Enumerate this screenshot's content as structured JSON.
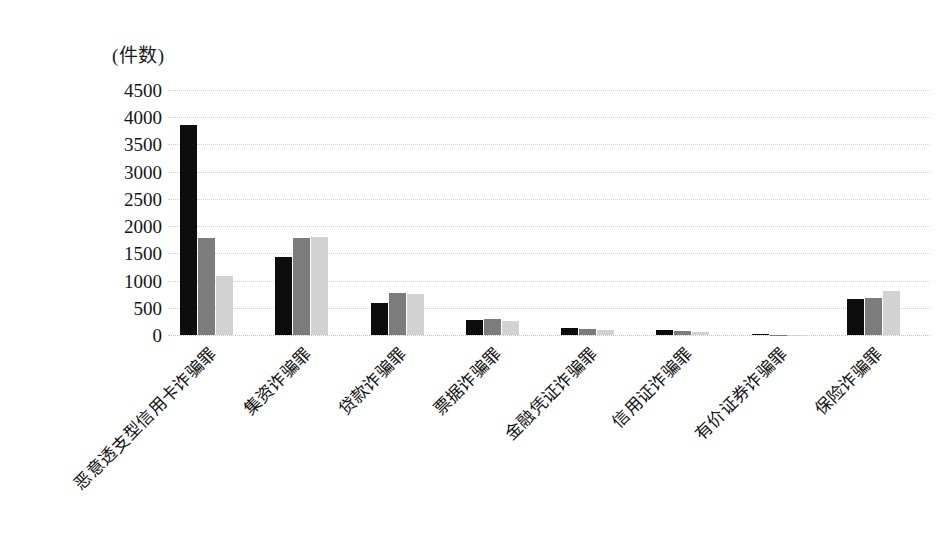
{
  "chart": {
    "unit_caption": "(件数)",
    "y_axis": {
      "ticks": [
        "0",
        "500",
        "1000",
        "1500",
        "2000",
        "2500",
        "3000",
        "3500",
        "4000",
        "4500"
      ],
      "min": 0,
      "max": 4500,
      "step": 500
    }
  },
  "chart_data": {
    "type": "bar",
    "title": "",
    "subtitle": "",
    "xlabel": "",
    "ylabel": "(件数)",
    "ylim": [
      0,
      4500
    ],
    "ytick_step": 500,
    "grid": true,
    "legend": "none",
    "orientation": "vertical",
    "grouping": "clustered",
    "categories": [
      "恶意透支型信用卡诈骗罪",
      "集资诈骗罪",
      "贷款诈骗罪",
      "票据诈骗罪",
      "金融凭证诈骗罪",
      "信用证诈骗罪",
      "有价证券诈骗罪",
      "保险诈骗罪"
    ],
    "series": [
      {
        "name": "series-1",
        "color": "#0d0d0d",
        "values": [
          3850,
          1440,
          590,
          280,
          120,
          100,
          10,
          660
        ]
      },
      {
        "name": "series-2",
        "color": "#7c7c7c",
        "values": [
          1790,
          1780,
          780,
          300,
          110,
          70,
          8,
          680
        ]
      },
      {
        "name": "series-3",
        "color": "#d2d2d2",
        "values": [
          1080,
          1800,
          760,
          250,
          90,
          50,
          5,
          800
        ]
      }
    ]
  }
}
